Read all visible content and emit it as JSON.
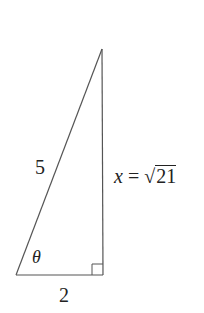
{
  "diagram": {
    "type": "right-triangle",
    "hypotenuse_label": "5",
    "adjacent_label": "2",
    "opposite_label": {
      "variable": "x",
      "equals": "=",
      "radical_sign": "√",
      "radicand": "21"
    },
    "angle_label": "θ",
    "right_angle_marker": true,
    "stroke_color": "#555555"
  }
}
